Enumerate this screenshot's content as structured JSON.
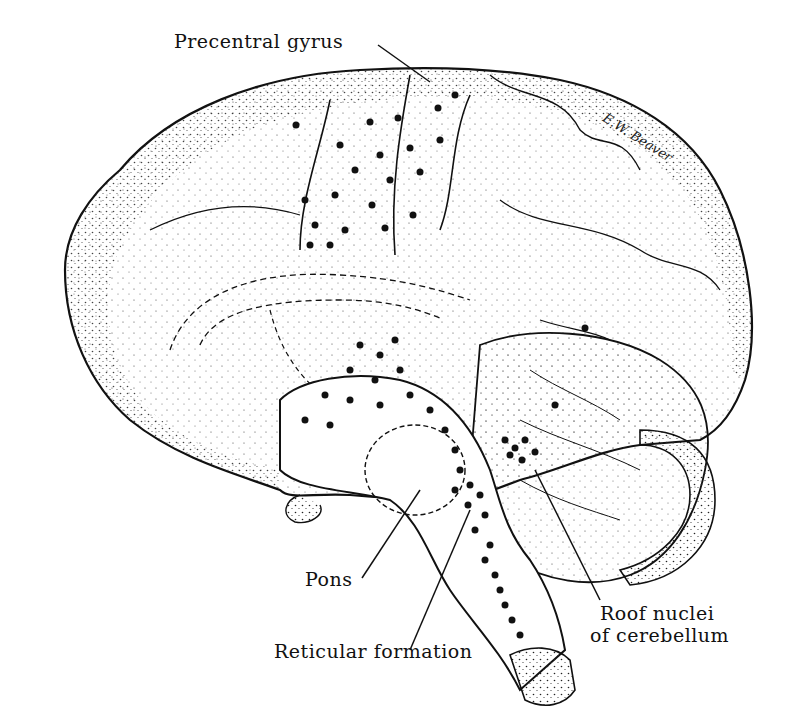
{
  "diagram": {
    "type": "anatomical-illustration",
    "labels": {
      "precentral_gyrus": "Precentral gyrus",
      "pons": "Pons",
      "reticular_formation": "Reticular formation",
      "roof_nuclei_line1": "Roof nuclei",
      "roof_nuclei_line2": "of cerebellum"
    },
    "signature": "E.W. Beaver",
    "colors": {
      "ink": "#111111",
      "background": "#ffffff"
    }
  }
}
